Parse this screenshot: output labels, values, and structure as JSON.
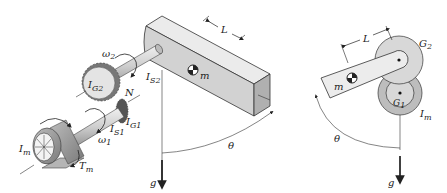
{
  "diagram": {
    "left_view": {
      "labels": {
        "omega2": "ω",
        "omega2_sub": "2",
        "IS2": "I",
        "IS2_sub": "S2",
        "IG2": "I",
        "IG2_sub": "G2",
        "N": "N",
        "IS1": "I",
        "IS1_sub": "S1",
        "IG1": "I",
        "IG1_sub": "G1",
        "omega1": "ω",
        "omega1_sub": "1",
        "Im": "I",
        "Im_sub": "m",
        "Tm": "T",
        "Tm_sub": "m",
        "L": "L",
        "m": "m",
        "theta": "θ",
        "g": "g"
      }
    },
    "right_view": {
      "labels": {
        "L": "L",
        "G2": "G",
        "G2_sub": "2",
        "m": "m",
        "G1": "G",
        "G1_sub": "1",
        "Im": "I",
        "Im_sub": "m",
        "theta": "θ",
        "g": "g"
      }
    },
    "colors": {
      "line": "#222222",
      "body_light": "#e6e6e6",
      "body_mid": "#cfcfcf",
      "body_dark": "#a8a8a8",
      "gear_light": "#dcdcdc",
      "gear_dark": "#9a9a9a"
    }
  }
}
